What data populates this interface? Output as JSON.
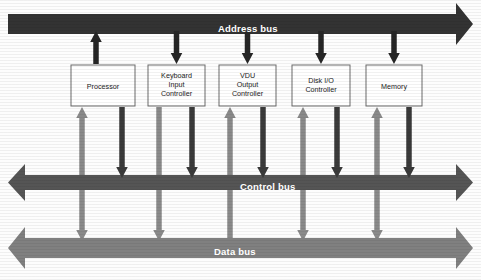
{
  "diagram": {
    "colors": {
      "address_bus": "#333333",
      "control_bus": "#555555",
      "data_bus": "#808080",
      "control_arrow": "#3a3a3a",
      "data_arrow": "#8a8a8a",
      "address_arrow": "#262626",
      "box_fill": "#ffffff",
      "box_stroke": "#6b6b6b",
      "label_text": "#1a1a1a",
      "bus_label_text": "#ffffff",
      "background": "#fdfdfd"
    },
    "buses": [
      {
        "id": "address-bus",
        "label": "Address bus",
        "direction": "right",
        "color": "#333333",
        "label_x": 218,
        "label_y": 24,
        "y": 14,
        "height": 20
      },
      {
        "id": "control-bus",
        "label": "Control bus",
        "direction": "both",
        "color": "#555555",
        "label_x": 240,
        "label_y": 182,
        "y": 175,
        "height": 15
      },
      {
        "id": "data-bus",
        "label": "Data bus",
        "direction": "both",
        "color": "#808080",
        "label_x": 214,
        "label_y": 247,
        "y": 238,
        "height": 20
      }
    ],
    "components": [
      {
        "id": "processor",
        "label": "Processor",
        "x": 71,
        "y": 65,
        "w": 64,
        "h": 41,
        "label_x": 71,
        "label_y": 82,
        "address_direction": "up",
        "data_direction": "both",
        "control_direction": "down"
      },
      {
        "id": "keyboard-input-controller",
        "label": "Keyboard\nInput\nController",
        "x": 148,
        "y": 65,
        "w": 57,
        "h": 41,
        "label_x": 148,
        "label_y": 71,
        "address_direction": "down",
        "data_direction": "down",
        "control_direction": "down"
      },
      {
        "id": "vdu-output-controller",
        "label": "VDU\nOutput\nController",
        "x": 219,
        "y": 65,
        "w": 57,
        "h": 41,
        "label_x": 219,
        "label_y": 71,
        "address_direction": "down",
        "data_direction": "up",
        "control_direction": "down"
      },
      {
        "id": "disk-io-controller",
        "label": "Disk I/O\nController",
        "x": 292,
        "y": 65,
        "w": 58,
        "h": 41,
        "label_x": 292,
        "label_y": 76,
        "address_direction": "down",
        "data_direction": "both",
        "control_direction": "down"
      },
      {
        "id": "memory",
        "label": "Memory",
        "x": 366,
        "y": 65,
        "w": 56,
        "h": 41,
        "label_x": 366,
        "label_y": 82,
        "address_direction": "down",
        "data_direction": "both",
        "control_direction": "down"
      }
    ]
  }
}
